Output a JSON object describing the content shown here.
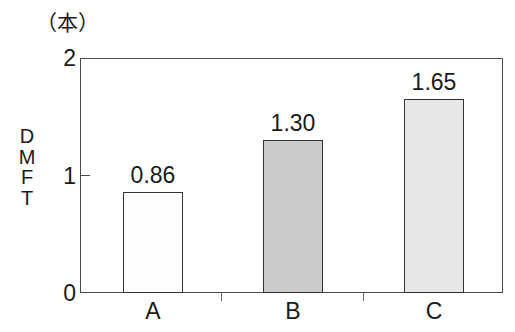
{
  "chart_data": {
    "type": "bar",
    "title": "",
    "subtitle": "",
    "unit_label": "（本）",
    "xlabel": "",
    "ylabel": "DMFT",
    "ylabel_chars": [
      "D",
      "M",
      "F",
      "T"
    ],
    "categories": [
      "A",
      "B",
      "C"
    ],
    "values": [
      0.86,
      1.3,
      1.65
    ],
    "value_labels": [
      "0.86",
      "1.30",
      "1.65"
    ],
    "ylim": [
      0,
      2
    ],
    "ytick_labels": [
      "0",
      "1",
      "2"
    ],
    "ytick_values": [
      0,
      1,
      2
    ],
    "grid": false,
    "legend": false,
    "bar_fills": [
      "#fdfdfd",
      "#cbcbcb",
      "#e7e7e7"
    ],
    "bar_edge_color": "#333333",
    "axis_color": "#4a4a4a",
    "background": "#ffffff"
  }
}
